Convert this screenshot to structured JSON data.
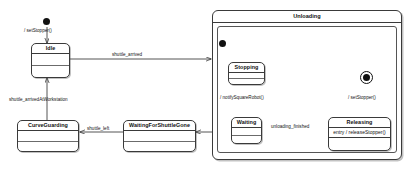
{
  "diagram": {
    "type": "uml-state-machine",
    "title": "",
    "states": [
      {
        "id": "idle",
        "name": "Idle"
      },
      {
        "id": "curve_guarding",
        "name": "CurveGuarding"
      },
      {
        "id": "waiting_for_shuttle_gone",
        "name": "WaitingForShuttleGone"
      },
      {
        "id": "unloading",
        "name": "Unloading"
      },
      {
        "id": "stopping",
        "name": "Stopping"
      },
      {
        "id": "waiting",
        "name": "Waiting"
      },
      {
        "id": "releasing",
        "name": "Releasing",
        "entry": "entry / releaseStopper()"
      }
    ],
    "pseudostates": [
      {
        "id": "initial_top",
        "kind": "initial"
      },
      {
        "id": "initial_unloading",
        "kind": "initial"
      },
      {
        "id": "final_unloading",
        "kind": "final"
      }
    ],
    "transitions": [
      {
        "id": "t1",
        "from": "initial_top",
        "to": "idle",
        "label": "/ setStopper()"
      },
      {
        "id": "t2",
        "from": "idle",
        "to": "unloading",
        "label": "shuttle_arrived"
      },
      {
        "id": "t3",
        "from": "curve_guarding",
        "to": "idle",
        "label": "shuttle_arrivedAtWorkstation"
      },
      {
        "id": "t4",
        "from": "waiting_for_shuttle_gone",
        "to": "curve_guarding",
        "label": "shuttle_left"
      },
      {
        "id": "t5",
        "from": "initial_unloading",
        "to": "stopping",
        "label": ""
      },
      {
        "id": "t6",
        "from": "stopping",
        "to": "waiting",
        "label": "/ notifySquareRobot()"
      },
      {
        "id": "t7",
        "from": "waiting",
        "to": "releasing",
        "label": "unloading_finished"
      },
      {
        "id": "t8",
        "from": "releasing",
        "to": "final_unloading",
        "label": "/ setStopper()"
      },
      {
        "id": "t9",
        "from": "unloading",
        "to": "waiting_for_shuttle_gone",
        "label": ""
      }
    ],
    "colors": {
      "stroke": "#3a3a3a",
      "text": "#111111",
      "background": "#ffffff",
      "node_fill": "#111111"
    }
  }
}
